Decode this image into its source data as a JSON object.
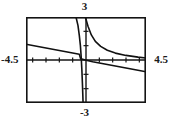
{
  "figure": {
    "name": "calculator-graph",
    "background": "#ffffff",
    "frame_color": "#141414",
    "curve_color": "#111111",
    "axis_color": "#141414"
  },
  "labels": {
    "ymax": "3",
    "ymin": "-3",
    "xmin": "-4.5",
    "xmax": "4.5"
  },
  "chart_data": {
    "type": "line",
    "title": "",
    "xlabel": "",
    "ylabel": "",
    "xlim": [
      -4.5,
      4.5
    ],
    "ylim": [
      -3,
      3
    ],
    "grid": false,
    "legend": "none",
    "xticks": [
      -4,
      -3,
      -2,
      -1,
      0,
      1,
      2,
      3,
      4
    ],
    "yticks": [
      -2,
      -1,
      0,
      1,
      2
    ],
    "tick_labels_shown": [
      "3",
      "-3",
      "-4.5",
      "4.5"
    ],
    "series": [
      {
        "name": "line",
        "type": "line",
        "description": "shallow decreasing straight line crossing x-axis near x = -0.4",
        "x": [
          -4.5,
          -3.5,
          -2.5,
          -1.5,
          -0.5,
          -0.4,
          0.5,
          1.5,
          2.5,
          3.5,
          4.5
        ],
        "y": [
          1.1,
          0.92,
          0.75,
          0.57,
          0.4,
          0.08,
          -0.12,
          -0.3,
          -0.47,
          -0.65,
          -0.82
        ]
      },
      {
        "name": "hyperbola-left-branch",
        "type": "line",
        "description": "steep decreasing branch left of vertical asymptote at x = -0.2, running from top of window down to bottom of window",
        "x": [
          -0.75,
          -0.6,
          -0.5,
          -0.42,
          -0.36,
          -0.31,
          -0.27,
          -0.24,
          -0.22
        ],
        "y": [
          3.0,
          2.4,
          1.7,
          1.0,
          0.2,
          -0.7,
          -1.6,
          -2.4,
          -3.0
        ]
      },
      {
        "name": "hyperbola-right-branch",
        "type": "line",
        "description": "decreasing branch right of the y-axis approaching the x-axis asymptotically",
        "x": [
          -0.05,
          0.15,
          0.4,
          0.7,
          1.1,
          1.6,
          2.2,
          3.0,
          3.9,
          4.5
        ],
        "y": [
          3.0,
          2.35,
          1.75,
          1.3,
          0.95,
          0.68,
          0.48,
          0.32,
          0.2,
          0.14
        ]
      }
    ]
  }
}
